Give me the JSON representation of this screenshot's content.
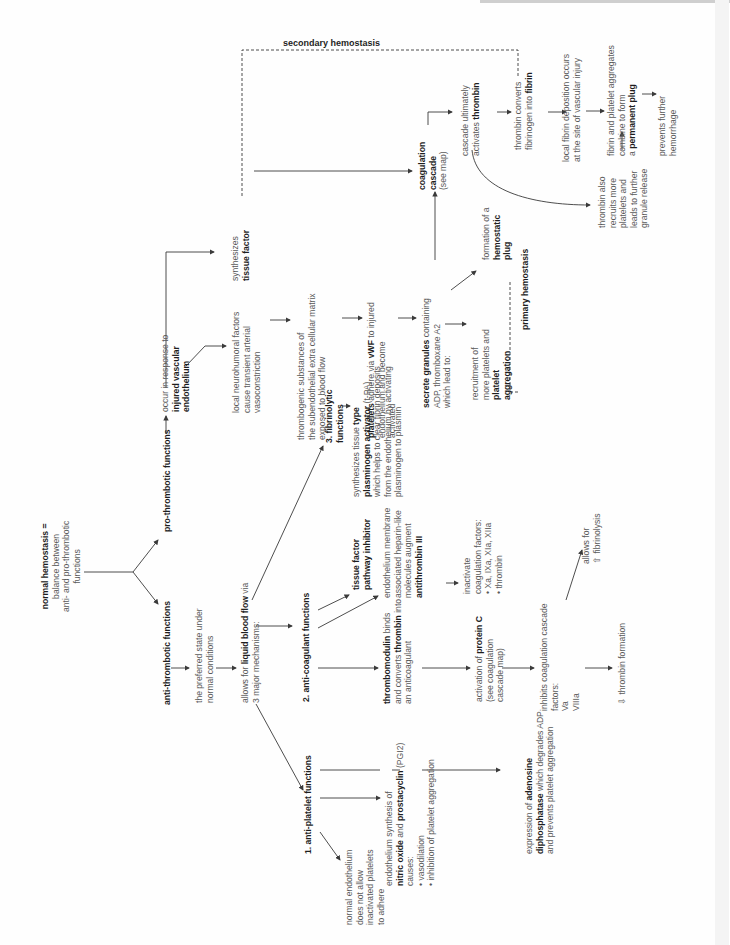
{
  "diagram": {
    "orientation": "rotated-90-ccw",
    "root": {
      "lines": [
        [
          {
            "t": "normal hemostasis =",
            "b": true
          }
        ],
        [
          {
            "t": "balance between",
            "b": false
          }
        ],
        [
          {
            "t": "anti- and pro-thrombotic",
            "b": false
          }
        ],
        [
          {
            "t": "functions",
            "b": false
          }
        ]
      ]
    },
    "pro_thrombotic": {
      "lines": [
        [
          {
            "t": "pro-thrombotic functions",
            "b": true
          }
        ]
      ]
    },
    "injured_endothelium": {
      "lines": [
        [
          {
            "t": "occur in response to",
            "b": false
          }
        ],
        [
          {
            "t": "injured vascular",
            "b": true
          }
        ],
        [
          {
            "t": "endothelium",
            "b": true
          }
        ]
      ]
    },
    "tissue_factor": {
      "lines": [
        [
          {
            "t": "synthesizes",
            "b": false
          }
        ],
        [
          {
            "t": "tissue factor",
            "b": true
          }
        ]
      ]
    },
    "neurohumoral": {
      "lines": [
        [
          {
            "t": "local neurohumoral factors",
            "b": false
          }
        ],
        [
          {
            "t": "cause transient arterial",
            "b": false
          }
        ],
        [
          {
            "t": "vasoconstriction",
            "b": false
          }
        ]
      ]
    },
    "thrombogenic": {
      "lines": [
        [
          {
            "t": "thrombogenic substances of",
            "b": false
          }
        ],
        [
          {
            "t": "the subendothelial extra cellular matrix",
            "b": false
          }
        ],
        [
          {
            "t": "exposed to blood flow",
            "b": false
          }
        ]
      ]
    },
    "platelets_adhere": {
      "lines": [
        [
          {
            "t": "platelets",
            "b": true
          },
          {
            "t": " adhere via ",
            "b": false
          },
          {
            "t": "vWF",
            "b": true
          },
          {
            "t": " to injured",
            "b": false
          }
        ],
        [
          {
            "t": "endothelium and become",
            "b": false
          }
        ],
        [
          {
            "t": "activated",
            "b": false
          }
        ]
      ]
    },
    "secrete_granules": {
      "lines": [
        [
          {
            "t": "secrete granules",
            "b": true
          },
          {
            "t": " containing",
            "b": false
          }
        ],
        [
          {
            "t": "ADP, thromboxane A2",
            "b": false
          }
        ],
        [
          {
            "t": "which lead to:",
            "b": false
          }
        ]
      ]
    },
    "recruitment": {
      "lines": [
        [
          {
            "t": "recruitment of",
            "b": false
          }
        ],
        [
          {
            "t": "more platelets and",
            "b": false
          }
        ],
        [
          {
            "t": "platelet",
            "b": true
          }
        ],
        [
          {
            "t": "aggregation",
            "b": true
          }
        ]
      ]
    },
    "hemostatic_plug": {
      "lines": [
        [
          {
            "t": "formation of a",
            "b": false
          }
        ],
        [
          {
            "t": "hemostatic",
            "b": true
          }
        ],
        [
          {
            "t": "plug",
            "b": true
          }
        ]
      ]
    },
    "primary_hemostasis": {
      "lines": [
        [
          {
            "t": "primary hemostasis",
            "b": true
          }
        ]
      ]
    },
    "coagulation_cascade": {
      "lines": [
        [
          {
            "t": "coagulation",
            "b": true
          }
        ],
        [
          {
            "t": "cascade",
            "b": true
          }
        ],
        [
          {
            "t": "(see map)",
            "b": false
          }
        ]
      ]
    },
    "activates_thrombin": {
      "lines": [
        [
          {
            "t": "cascade ultimately",
            "b": false
          }
        ],
        [
          {
            "t": "activates ",
            "b": false
          },
          {
            "t": "thrombin",
            "b": true
          }
        ]
      ]
    },
    "thrombin_converts": {
      "lines": [
        [
          {
            "t": "thrombin converts",
            "b": false
          }
        ],
        [
          {
            "t": "fibrinogen into ",
            "b": false
          },
          {
            "t": "fibrin",
            "b": true
          }
        ]
      ]
    },
    "fibrin_deposition": {
      "lines": [
        [
          {
            "t": "local fibrin deposition occurs",
            "b": false
          }
        ],
        [
          {
            "t": "at the site of vascular injury",
            "b": false
          }
        ]
      ]
    },
    "permanent_plug": {
      "lines": [
        [
          {
            "t": "fibrin and platelet aggregates",
            "b": false
          }
        ],
        [
          {
            "t": "combine to form",
            "b": false
          }
        ],
        [
          {
            "t": "a ",
            "b": false
          },
          {
            "t": "permanent plug",
            "b": true
          }
        ]
      ]
    },
    "prevents_hemorrhage": {
      "lines": [
        [
          {
            "t": "prevents further",
            "b": false
          }
        ],
        [
          {
            "t": "hemorrhage",
            "b": false
          }
        ]
      ]
    },
    "thrombin_recruits": {
      "lines": [
        [
          {
            "t": "thrombin also",
            "b": false
          }
        ],
        [
          {
            "t": "recruits more",
            "b": false
          }
        ],
        [
          {
            "t": "platelets and",
            "b": false
          }
        ],
        [
          {
            "t": "leads to further",
            "b": false
          }
        ],
        [
          {
            "t": "granule release",
            "b": false
          }
        ]
      ]
    },
    "secondary_hemostasis": "secondary hemostasis",
    "anti_thrombotic": {
      "lines": [
        [
          {
            "t": "anti-thrombotic functions",
            "b": true
          }
        ]
      ]
    },
    "preferred_state": {
      "lines": [
        [
          {
            "t": "the preferred state under",
            "b": false
          }
        ],
        [
          {
            "t": "normal conditions",
            "b": false
          }
        ]
      ]
    },
    "liquid_blood_flow": {
      "lines": [
        [
          {
            "t": "allows for ",
            "b": false
          },
          {
            "t": "liquid blood flow",
            "b": true
          },
          {
            "t": " via",
            "b": false
          }
        ],
        [
          {
            "t": "3 major mechanisms:",
            "b": false
          }
        ]
      ]
    },
    "fibrinolytic": {
      "lines": [
        [
          {
            "t": "3. fibrinolytic",
            "b": true
          }
        ],
        [
          {
            "t": "functions",
            "b": true
          }
        ]
      ]
    },
    "tpa": {
      "lines": [
        [
          {
            "t": "synthesizes tissue ",
            "b": false
          },
          {
            "t": "type",
            "b": true
          }
        ],
        [
          {
            "t": "plasminogen activator",
            "b": true
          },
          {
            "t": " (t-PA)",
            "b": false
          }
        ],
        [
          {
            "t": "which helps to clear fibrin deposits",
            "b": false
          }
        ],
        [
          {
            "t": "from the endothelium by activating",
            "b": false
          }
        ],
        [
          {
            "t": "plasminogen to plasmin",
            "b": false
          }
        ]
      ]
    },
    "anti_coagulant": {
      "lines": [
        [
          {
            "t": "2. anti-coagulant functions",
            "b": true
          }
        ]
      ]
    },
    "tfpi": {
      "lines": [
        [
          {
            "t": "tissue factor",
            "b": true
          }
        ],
        [
          {
            "t": "pathway inhibitor",
            "b": true
          }
        ]
      ]
    },
    "heparin_like": {
      "lines": [
        [
          {
            "t": "endothelium membrane",
            "b": false
          }
        ],
        [
          {
            "t": "associated heparin-like",
            "b": false
          }
        ],
        [
          {
            "t": "molecules augment",
            "b": false
          }
        ],
        [
          {
            "t": "antithrombin III",
            "b": true
          }
        ]
      ]
    },
    "inactivate_factors": {
      "lines": [
        [
          {
            "t": "inactivate",
            "b": false
          }
        ],
        [
          {
            "t": "coagulation factors:",
            "b": false
          }
        ],
        [
          {
            "t": "• Xa, IXa, XIa, XIIa",
            "b": false
          }
        ],
        [
          {
            "t": "• thrombin",
            "b": false
          }
        ]
      ]
    },
    "thrombomodulin": {
      "lines": [
        [
          {
            "t": "thrombomodulin",
            "b": true
          },
          {
            "t": " binds",
            "b": false
          }
        ],
        [
          {
            "t": "and converts ",
            "b": false
          },
          {
            "t": "thrombin",
            "b": true
          },
          {
            "t": " into",
            "b": false
          }
        ],
        [
          {
            "t": "an anticoagulant",
            "b": false
          }
        ]
      ]
    },
    "protein_c": {
      "lines": [
        [
          {
            "t": "activation of ",
            "b": false
          },
          {
            "t": "protein C",
            "b": true
          }
        ],
        [
          {
            "t": "(see coagulation",
            "b": false
          }
        ],
        [
          {
            "t": "cascade map)",
            "b": false
          }
        ]
      ]
    },
    "inhibits_cascade": {
      "lines": [
        [
          {
            "t": "inhibits coagulation cascade",
            "b": false
          }
        ],
        [
          {
            "t": "factors:",
            "b": false
          }
        ],
        [
          {
            "t": "Va",
            "b": false
          }
        ],
        [
          {
            "t": "VIIIa",
            "b": false
          }
        ]
      ]
    },
    "fibrinolysis": {
      "lines": [
        [
          {
            "t": "allows for",
            "b": false
          }
        ],
        [
          {
            "t": "⇧ fibrinolysis",
            "b": false
          }
        ]
      ]
    },
    "thrombin_formation": {
      "lines": [
        [
          {
            "t": "⇩ thrombin formation",
            "b": false
          }
        ]
      ]
    },
    "anti_platelet": {
      "lines": [
        [
          {
            "t": "1. anti-platelet functions",
            "b": true
          }
        ]
      ]
    },
    "normal_endothelium": {
      "lines": [
        [
          {
            "t": "normal endothelium",
            "b": false
          }
        ],
        [
          {
            "t": "does not allow",
            "b": false
          }
        ],
        [
          {
            "t": "inactivated platelets",
            "b": false
          }
        ],
        [
          {
            "t": "to adhere",
            "b": false
          }
        ]
      ]
    },
    "no_prostacyclin": {
      "lines": [
        [
          {
            "t": "endothelium synthesis of",
            "b": false
          }
        ],
        [
          {
            "t": "nitric oxide",
            "b": true
          },
          {
            "t": " and ",
            "b": false
          },
          {
            "t": "prostacyclin",
            "b": true
          },
          {
            "t": " (PGI2)",
            "b": false
          }
        ],
        [
          {
            "t": "causes:",
            "b": false
          }
        ],
        [
          {
            "t": "• vasodilation",
            "b": false
          }
        ],
        [
          {
            "t": "• inhibition of platelet aggregation",
            "b": false
          }
        ]
      ]
    },
    "adp_ase": {
      "lines": [
        [
          {
            "t": "expression of ",
            "b": false
          },
          {
            "t": "adenosine",
            "b": true
          }
        ],
        [
          {
            "t": "diphosphatase",
            "b": true
          },
          {
            "t": " which degrades ADP",
            "b": false
          }
        ],
        [
          {
            "t": "and prevents platelet aggregation",
            "b": false
          }
        ]
      ]
    }
  },
  "colors": {
    "line": "#3a3a3a",
    "text": "#5a5a5a",
    "bold": "#1e1e1e",
    "background": "#fefefe"
  }
}
